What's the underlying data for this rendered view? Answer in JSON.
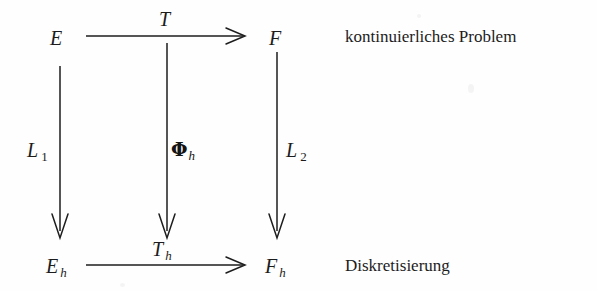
{
  "diagram": {
    "type": "commutative-diagram",
    "background_color": "#fefefe",
    "ink_color": "#1d1d1d",
    "nodes": {
      "top_left": "E",
      "top_right": "F",
      "bottom_left_base": "E",
      "bottom_left_sub": "h",
      "bottom_right_base": "F",
      "bottom_right_sub": "h"
    },
    "arrows": {
      "top_horizontal_label": "T",
      "bottom_horizontal_label_base": "T",
      "bottom_horizontal_label_sub": "h",
      "left_vertical_label_base": "L",
      "left_vertical_label_sub": "1",
      "middle_vertical_label_base": "Φ",
      "middle_vertical_label_sub": "h",
      "right_vertical_label_base": "L",
      "right_vertical_label_sub": "2"
    },
    "captions": {
      "top_row": "kontinuierliches Problem",
      "bottom_row": "Diskretisierung"
    }
  }
}
